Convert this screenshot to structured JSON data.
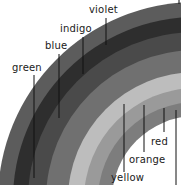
{
  "diagram": {
    "center": {
      "x": 196,
      "y": 200
    },
    "bands": [
      {
        "name": "violet",
        "label": "violet",
        "outer_r": 198,
        "inner_r": 183,
        "color": "#5c5c5c"
      },
      {
        "name": "indigo",
        "label": "indigo",
        "outer_r": 183,
        "inner_r": 168,
        "color": "#2e2e2e"
      },
      {
        "name": "blue",
        "label": "blue",
        "outer_r": 168,
        "inner_r": 150,
        "color": "#4a4a4a"
      },
      {
        "name": "green",
        "label": "green",
        "outer_r": 150,
        "inner_r": 128,
        "color": "#707070"
      },
      {
        "name": "yellow",
        "label": "yellow",
        "outer_r": 128,
        "inner_r": 112,
        "color": "#bdbdbd"
      },
      {
        "name": "orange",
        "label": "orange",
        "outer_r": 112,
        "inner_r": 98,
        "color": "#9a9a9a"
      },
      {
        "name": "red",
        "label": "red",
        "outer_r": 98,
        "inner_r": 84,
        "color": "#7d7d7d"
      }
    ],
    "labels": {
      "violet": "violet",
      "indigo": "indigo",
      "blue": "blue",
      "green": "green",
      "yellow": "yellow",
      "orange": "orange",
      "red": "red"
    },
    "leader_color": "#111111"
  }
}
